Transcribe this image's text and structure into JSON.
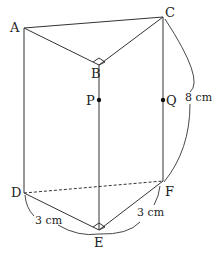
{
  "figure": {
    "type": "triangular prism",
    "vertices": {
      "A": {
        "label": "A",
        "x": 24,
        "y": 28
      },
      "B": {
        "label": "B",
        "x": 99,
        "y": 65
      },
      "C": {
        "label": "C",
        "x": 163,
        "y": 17
      },
      "D": {
        "label": "D",
        "x": 24,
        "y": 193
      },
      "E": {
        "label": "E",
        "x": 99,
        "y": 230
      },
      "F": {
        "label": "F",
        "x": 163,
        "y": 181
      }
    },
    "points": {
      "P": {
        "label": "P",
        "x": 99,
        "y": 100
      },
      "Q": {
        "label": "Q",
        "x": 163,
        "y": 100
      }
    },
    "right_angles": [
      "ABC",
      "DEF"
    ],
    "hidden_edges": [
      "DF"
    ],
    "measurements": {
      "CF": "8 cm",
      "DE": "3 cm",
      "EF": "3 cm"
    }
  }
}
